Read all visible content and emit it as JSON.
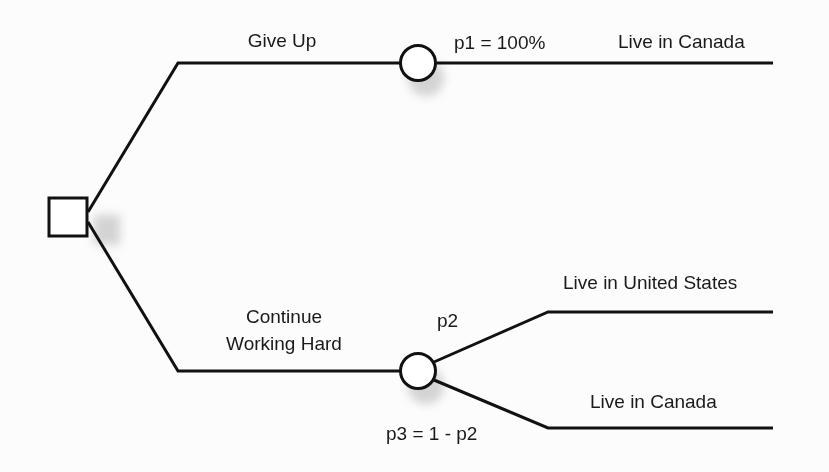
{
  "diagram": {
    "type": "decision-tree",
    "colors": {
      "line": "#111111",
      "text": "#1a1a1a",
      "background": "#fcfcfc",
      "shadow": "#bbbbbb"
    },
    "decision_node": {
      "shape": "square"
    },
    "branches": [
      {
        "label": "Give Up",
        "chance_node": {
          "shape": "circle"
        },
        "outcomes": [
          {
            "probability_label": "p1 = 100%",
            "label": "Live in Canada"
          }
        ]
      },
      {
        "label_line1": "Continue",
        "label_line2": "Working Hard",
        "chance_node": {
          "shape": "circle"
        },
        "outcomes": [
          {
            "probability_label": "p2",
            "label": "Live in United States"
          },
          {
            "probability_label": "p3 = 1 - p2",
            "label": "Live in Canada"
          }
        ]
      }
    ]
  }
}
